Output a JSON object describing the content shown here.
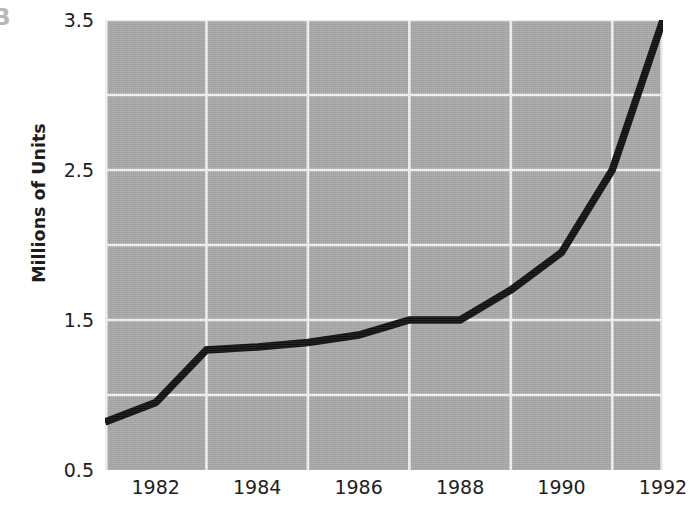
{
  "figure": {
    "panel_letter": "B",
    "background_color": "#ffffff",
    "plot_background_color": "#a8a8a8",
    "grid_color": "#f2f2f2",
    "line_color": "#101010"
  },
  "chart_data": {
    "type": "line",
    "title": "",
    "subtitle": "",
    "xlabel": "",
    "ylabel": "Millions of Units",
    "xlim": [
      1981,
      1992
    ],
    "ylim": [
      0.5,
      3.5
    ],
    "grid": true,
    "legend": null,
    "legend_position": "none",
    "x_tick_labels": [
      "1982",
      "1984",
      "1986",
      "1988",
      "1990",
      "1992"
    ],
    "x_tick_values": [
      1982,
      1984,
      1986,
      1988,
      1990,
      1992
    ],
    "y_tick_labels": [
      "0.5",
      "1.5",
      "2.5",
      "3.5"
    ],
    "y_tick_values": [
      0.5,
      1.5,
      2.5,
      3.5
    ],
    "x_gridline_values": [
      1981,
      1983,
      1985,
      1987,
      1989,
      1991,
      1992
    ],
    "y_gridline_values": [
      1.0,
      1.5,
      2.0,
      2.5,
      3.0,
      3.5
    ],
    "x": [
      1981,
      1982,
      1983,
      1984,
      1985,
      1986,
      1987,
      1988,
      1989,
      1990,
      1991,
      1992
    ],
    "values": [
      0.82,
      0.95,
      1.3,
      1.32,
      1.35,
      1.4,
      1.5,
      1.5,
      1.7,
      1.95,
      2.5,
      3.5
    ],
    "series": [
      {
        "name": "Millions of Units",
        "values": [
          0.82,
          0.95,
          1.3,
          1.32,
          1.35,
          1.4,
          1.5,
          1.5,
          1.7,
          1.95,
          2.5,
          3.5
        ]
      }
    ],
    "annotations": []
  }
}
